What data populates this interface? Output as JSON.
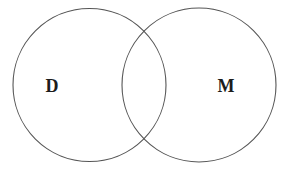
{
  "figure": {
    "kind": "venn-diagram",
    "sets_count": 2,
    "background_color": "#ffffff",
    "stroke_color": "#555555",
    "stroke_width": 1.1,
    "label_color": "#1c1c1c"
  },
  "sets": [
    {
      "id": "left",
      "label": "D",
      "label_x": 52,
      "label_y": 86,
      "center_x": 89.5,
      "center_y": 85,
      "radius": 76.5
    },
    {
      "id": "right",
      "label": "M",
      "label_x": 226,
      "label_y": 86,
      "center_x": 199,
      "center_y": 85,
      "radius": 77
    }
  ],
  "intersection": {
    "label": "",
    "upper_point_x": 145,
    "upper_point_y": 30,
    "lower_point_x": 145,
    "lower_point_y": 140
  }
}
